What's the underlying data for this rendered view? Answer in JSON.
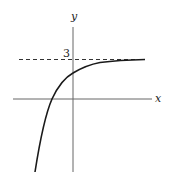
{
  "figure": {
    "type": "function-graph",
    "axes": {
      "x_label": "x",
      "y_label": "y"
    },
    "asymptote": {
      "label": "3",
      "value": 3,
      "style": "dashed"
    },
    "curve": {
      "description": "increasing concave-down curve approaching horizontal asymptote y = 3",
      "color": "#1a1a1a"
    },
    "colors": {
      "axis": "#555555",
      "curve": "#1a1a1a",
      "dashed": "#333333"
    }
  }
}
